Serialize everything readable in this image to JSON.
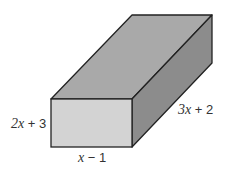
{
  "diagram": {
    "type": "rectangular-prism",
    "colors": {
      "front_face": "#d3d3d3",
      "top_face": "#a9a9a9",
      "side_face": "#8c8c8c",
      "edge": "#222222"
    },
    "labels": {
      "height": {
        "var": "2x",
        "rest": " + 3",
        "full": "2x + 3"
      },
      "width": {
        "var": "x",
        "rest": " − 1",
        "full": "x − 1"
      },
      "depth": {
        "var": "3x",
        "rest": " + 2",
        "full": "3x + 2"
      }
    }
  }
}
